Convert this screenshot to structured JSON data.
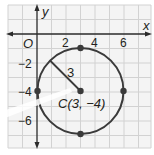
{
  "diagram": {
    "type": "coordinate-plane-circle",
    "axes": {
      "x_label": "x",
      "y_label": "y",
      "origin_label": "O",
      "x_ticks": [
        "2",
        "4",
        "6"
      ],
      "y_ticks": [
        "−2",
        "−4",
        "−6"
      ]
    },
    "circle": {
      "center_label": "C(3, −4)",
      "center": [
        3,
        -4
      ],
      "radius": 3,
      "radius_label": "3",
      "points": [
        [
          3,
          -1
        ],
        [
          6,
          -4
        ],
        [
          3,
          -7
        ],
        [
          0,
          -4
        ]
      ]
    },
    "colors": {
      "grid": "#d4d4d4",
      "grid_bg": "#f2f2f2",
      "ink": "#3a3a3a"
    }
  }
}
